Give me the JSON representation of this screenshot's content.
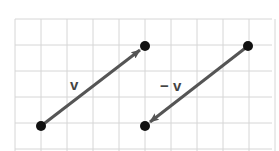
{
  "diagram": {
    "title": "",
    "grid": {
      "x0": 15,
      "y0": 19,
      "cell": 26,
      "cols": 10,
      "rows": 5,
      "color": "#d6d6d6"
    },
    "vectors": [
      {
        "label": "v",
        "from": [
          41,
          126
        ],
        "to": [
          145,
          46
        ]
      },
      {
        "label": "− v",
        "from": [
          248,
          46
        ],
        "to": [
          145,
          126
        ]
      }
    ],
    "labels": {
      "v": "v",
      "neg_v": "− v"
    },
    "colors": {
      "vector": "#555555",
      "point": "#111111"
    }
  }
}
